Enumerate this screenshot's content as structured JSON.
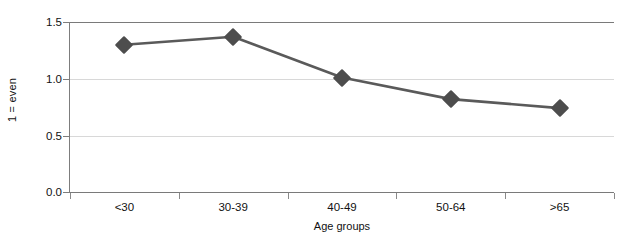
{
  "chart_data": {
    "type": "line",
    "title": "",
    "xlabel": "Age groups",
    "ylabel": "1 = even",
    "categories": [
      "<30",
      "30-39",
      "40-49",
      "50-64",
      ">65"
    ],
    "values": [
      1.3,
      1.37,
      1.01,
      0.82,
      0.74
    ],
    "series": [
      {
        "name": "",
        "values": [
          1.3,
          1.37,
          1.01,
          0.82,
          0.74
        ]
      }
    ],
    "ylim": [
      0.0,
      1.5
    ],
    "yticks": [
      "0.0",
      "0.5",
      "1.0",
      "1.5"
    ],
    "ytick_values": [
      0.0,
      0.5,
      1.0,
      1.5
    ],
    "grid": true,
    "grid_axis": "y",
    "legend": false,
    "marker": "diamond",
    "colors": {
      "line": "#5a5a5a",
      "marker": "#4d4d4d",
      "gridline": "#d8d8d8",
      "axis": "#7d7d7d",
      "text": "#111111",
      "background": "#ffffff"
    }
  }
}
